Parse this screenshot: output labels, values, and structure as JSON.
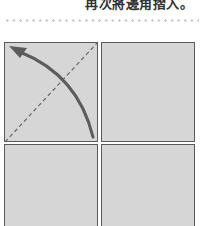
{
  "caption": {
    "text": "再次將邊角摺入。"
  },
  "diagram": {
    "colors": {
      "paper": "#d6d6d6",
      "border": "#5a5a5a",
      "arrow": "#5c5c5c",
      "fold_line": "#666666",
      "dotted_rule": "#c8c8c8"
    },
    "quadrants": [
      "top-left",
      "top-right",
      "bottom-left",
      "bottom-right"
    ],
    "fold_line": "dashed diagonal bottom-left to top-right in top-left quadrant",
    "arrow": "curved arrow from bottom-right toward top-left corner"
  }
}
